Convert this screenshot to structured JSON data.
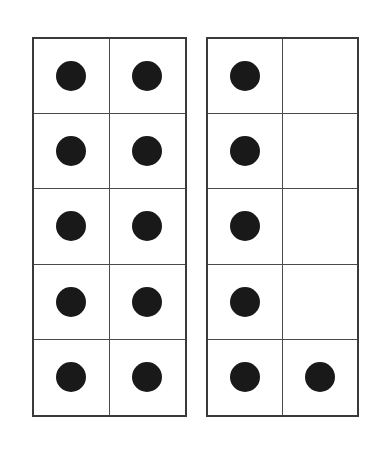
{
  "diagram": {
    "type": "ten-frame-pair",
    "background_color": "#ffffff",
    "dot_color": "#191919",
    "line_color": "#3a3a3a",
    "inner_line_color": "#4a4a4a",
    "columns": 2,
    "rows": 5,
    "total_cells_per_frame": 10
  },
  "frames": [
    {
      "name": "left-ten-frame",
      "label": "Left ten frame",
      "filled_count": 10,
      "empty_count": 0,
      "rows": [
        {
          "cells": [
            {
              "filled": true
            },
            {
              "filled": true
            }
          ]
        },
        {
          "cells": [
            {
              "filled": true
            },
            {
              "filled": true
            }
          ]
        },
        {
          "cells": [
            {
              "filled": true
            },
            {
              "filled": true
            }
          ]
        },
        {
          "cells": [
            {
              "filled": true
            },
            {
              "filled": true
            }
          ]
        },
        {
          "cells": [
            {
              "filled": true
            },
            {
              "filled": true
            }
          ]
        }
      ]
    },
    {
      "name": "right-ten-frame",
      "label": "Right ten frame",
      "filled_count": 6,
      "empty_count": 4,
      "rows": [
        {
          "cells": [
            {
              "filled": true
            },
            {
              "filled": false
            }
          ]
        },
        {
          "cells": [
            {
              "filled": true
            },
            {
              "filled": false
            }
          ]
        },
        {
          "cells": [
            {
              "filled": true
            },
            {
              "filled": false
            }
          ]
        },
        {
          "cells": [
            {
              "filled": true
            },
            {
              "filled": false
            }
          ]
        },
        {
          "cells": [
            {
              "filled": true
            },
            {
              "filled": true
            }
          ]
        }
      ]
    }
  ]
}
